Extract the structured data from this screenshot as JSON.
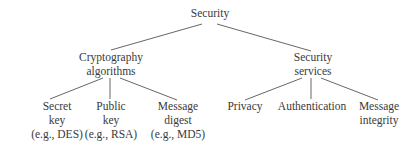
{
  "diagram": {
    "type": "tree",
    "root": {
      "label": "Security",
      "children": [
        {
          "label_lines": [
            "Cryptography",
            "algorithms"
          ],
          "children": [
            {
              "label_lines": [
                "Secret",
                "key",
                "(e.g., DES)"
              ]
            },
            {
              "label_lines": [
                "Public",
                "key",
                "(e.g., RSA)"
              ]
            },
            {
              "label_lines": [
                "Message",
                "digest",
                "(e.g., MD5)"
              ]
            }
          ]
        },
        {
          "label_lines": [
            "Security",
            "services"
          ],
          "children": [
            {
              "label_lines": [
                "Privacy"
              ]
            },
            {
              "label_lines": [
                "Authentication"
              ]
            },
            {
              "label_lines": [
                "Message",
                "integrity"
              ]
            }
          ]
        }
      ]
    },
    "colors": {
      "text": "#3a3a3a",
      "edge": "#555555",
      "background": "#ffffff"
    }
  }
}
